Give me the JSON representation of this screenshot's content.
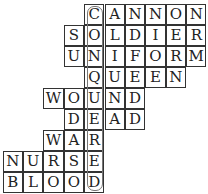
{
  "puzzle": {
    "type": "crossword-acrostic",
    "cell_width": 20.4,
    "cell_height": 21,
    "origin_x": 3,
    "origin_y": 4,
    "key_column": 4,
    "hidden_word": "CONQUERED",
    "rows": [
      {
        "word": "CANNON",
        "start_col": 4
      },
      {
        "word": "SOLDIER",
        "start_col": 3
      },
      {
        "word": "UNIFORM",
        "start_col": 3
      },
      {
        "word": "QUEEN",
        "start_col": 4
      },
      {
        "word": "WOUND",
        "start_col": 2
      },
      {
        "word": "DEAD",
        "start_col": 3
      },
      {
        "word": "WAR",
        "start_col": 2
      },
      {
        "word": "NURSE",
        "start_col": 0
      },
      {
        "word": "BLOOD",
        "start_col": 0
      }
    ]
  },
  "colors": {
    "grid_line": "#333333",
    "letter": "#222222",
    "highlight_border": "#777777",
    "background": "#ffffff"
  }
}
